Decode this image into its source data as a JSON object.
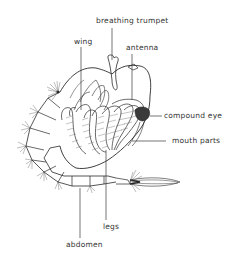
{
  "diagram": {
    "labels": {
      "breathing_trumpet": "breathing trumpet",
      "wing": "wing",
      "antenna": "antenna",
      "compound_eye": "compound eye",
      "mouth_parts": "mouth parts",
      "legs": "legs",
      "abdomen": "abdomen"
    },
    "colors": {
      "line": "#2a2a2a",
      "text": "#333333",
      "eye": "#3a3a3a",
      "background": "#ffffff"
    }
  }
}
